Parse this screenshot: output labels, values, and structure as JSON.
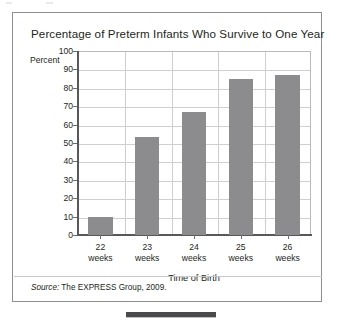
{
  "figure": {
    "title": "Percentage of Preterm Infants Who Survive to One Year",
    "percent_axis_label": "Percent",
    "source_prefix": "Source:",
    "source_text": " The EXPRESS Group, 2009."
  },
  "colors": {
    "bar_fill": "#8c8c8e",
    "frame_border": "#8e8e90",
    "gridline": "#cfcfd1",
    "axis_line": "#58585a",
    "text": "#231f20",
    "bottom_bar": "#4b4b4d"
  },
  "chart_data": {
    "type": "bar",
    "title": "Percentage of Preterm Infants Who Survive to One Year",
    "xlabel": "Time of Birth",
    "ylabel": "Percent",
    "categories": [
      "22 weeks",
      "23 weeks",
      "24 weeks",
      "25 weeks",
      "26 weeks"
    ],
    "category_lines": [
      [
        "22",
        "weeks"
      ],
      [
        "23",
        "weeks"
      ],
      [
        "24",
        "weeks"
      ],
      [
        "25",
        "weeks"
      ],
      [
        "26",
        "weeks"
      ]
    ],
    "values": [
      10,
      53,
      67,
      85,
      87
    ],
    "ylim": [
      0,
      100
    ],
    "ytick_labels": [
      "100",
      "90",
      "80",
      "70",
      "60",
      "50",
      "40",
      "30",
      "20",
      "10",
      "0"
    ],
    "ytick_values": [
      100,
      90,
      80,
      70,
      60,
      50,
      40,
      30,
      20,
      10,
      0
    ],
    "grid": true,
    "legend": "none",
    "source": "Source: The EXPRESS Group, 2009."
  }
}
